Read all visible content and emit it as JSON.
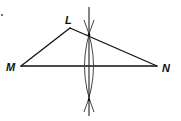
{
  "figure": {
    "type": "geometric-construction",
    "points": {
      "L": {
        "label": "L",
        "x": 70,
        "y": 28
      },
      "M": {
        "label": "M",
        "x": 21,
        "y": 66
      },
      "N": {
        "label": "N",
        "x": 157,
        "y": 66
      }
    },
    "segments": [
      "LM",
      "LN",
      "MN"
    ],
    "construction": {
      "bisector_x": 89,
      "top_intersection_y": 35,
      "bottom_intersection_y": 100
    },
    "colors": {
      "line": "#111111",
      "background": "#ffffff"
    }
  },
  "labels": {
    "L": "L",
    "M": "M",
    "N": "N"
  }
}
